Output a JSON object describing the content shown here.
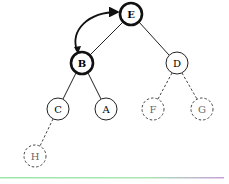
{
  "diagram": {
    "type": "binary-tree",
    "nodes": [
      {
        "id": "E",
        "label": "E",
        "x": 131,
        "y": 14,
        "style": "bold"
      },
      {
        "id": "B",
        "label": "B",
        "x": 82,
        "y": 63,
        "style": "bold"
      },
      {
        "id": "D",
        "label": "D",
        "x": 177,
        "y": 63,
        "style": "normal"
      },
      {
        "id": "C",
        "label": "C",
        "x": 58,
        "y": 109,
        "style": "normal"
      },
      {
        "id": "A",
        "label": "A",
        "x": 106,
        "y": 109,
        "style": "normal"
      },
      {
        "id": "F",
        "label": "F",
        "x": 153,
        "y": 109,
        "style": "dashed"
      },
      {
        "id": "G",
        "label": "G",
        "x": 202,
        "y": 109,
        "style": "dashed"
      },
      {
        "id": "H",
        "label": "H",
        "x": 35,
        "y": 156,
        "style": "dashed"
      }
    ],
    "edges": [
      {
        "from": "E",
        "to": "B",
        "style": "solid"
      },
      {
        "from": "E",
        "to": "D",
        "style": "solid"
      },
      {
        "from": "B",
        "to": "C",
        "style": "solid"
      },
      {
        "from": "B",
        "to": "A",
        "style": "solid"
      },
      {
        "from": "D",
        "to": "F",
        "style": "dashed"
      },
      {
        "from": "D",
        "to": "G",
        "style": "dashed"
      },
      {
        "from": "C",
        "to": "H",
        "style": "dashed"
      }
    ],
    "swap_arrow": {
      "between": [
        "B",
        "E"
      ],
      "bidirectional": true
    },
    "colors": {
      "stroke": "#111111",
      "dashed_stroke": "#555555",
      "rule_left": "#9be6a8",
      "rule_right": "#c7a0d8"
    }
  }
}
